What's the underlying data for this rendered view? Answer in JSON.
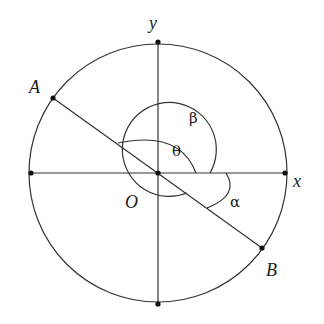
{
  "diagram": {
    "title": "",
    "center": {
      "x": 158,
      "y": 173
    },
    "main_circle_radius": 130,
    "axes": {
      "x_label": "x",
      "y_label": "y"
    },
    "points": {
      "A": {
        "label": "A"
      },
      "B": {
        "label": "B"
      },
      "O": {
        "label": "O"
      }
    },
    "angles": {
      "theta": {
        "label": "θ"
      },
      "beta": {
        "label": "β"
      },
      "alpha": {
        "label": "α"
      }
    }
  }
}
